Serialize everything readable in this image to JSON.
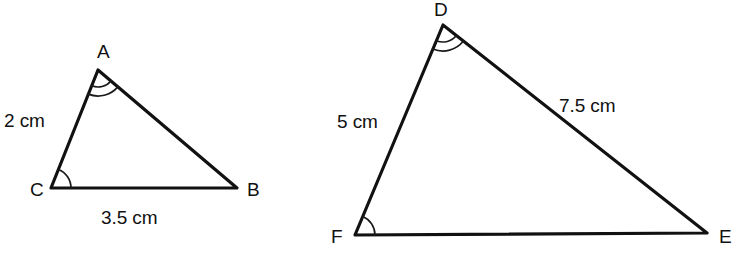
{
  "figure": {
    "background_color": "#ffffff",
    "stroke_color": "#111111",
    "label_color": "#111111"
  },
  "triangles": [
    {
      "name": "triangle-abc",
      "vertices": [
        {
          "label": "A",
          "x": 98,
          "y": 70,
          "label_x": 97,
          "label_y": 58,
          "arc_count": 2
        },
        {
          "label": "B",
          "x": 237,
          "y": 188,
          "label_x": 247,
          "label_y": 196,
          "arc_count": 0
        },
        {
          "label": "C",
          "x": 51,
          "y": 188,
          "label_x": 30,
          "label_y": 196,
          "arc_count": 1
        }
      ],
      "side_labels": [
        {
          "text": "2 cm",
          "x": 4,
          "y": 127,
          "side": "CA"
        },
        {
          "text": "3.5 cm",
          "x": 101,
          "y": 224,
          "side": "CB"
        }
      ]
    },
    {
      "name": "triangle-def",
      "vertices": [
        {
          "label": "D",
          "x": 443,
          "y": 25,
          "label_x": 434,
          "label_y": 16,
          "arc_count": 2
        },
        {
          "label": "E",
          "x": 707,
          "y": 233,
          "label_x": 719,
          "label_y": 243,
          "arc_count": 0
        },
        {
          "label": "F",
          "x": 355,
          "y": 235,
          "label_x": 331,
          "label_y": 243,
          "arc_count": 1
        }
      ],
      "side_labels": [
        {
          "text": "5 cm",
          "x": 337,
          "y": 128,
          "side": "FD"
        },
        {
          "text": "7.5 cm",
          "x": 559,
          "y": 112,
          "side": "DE"
        }
      ]
    }
  ]
}
